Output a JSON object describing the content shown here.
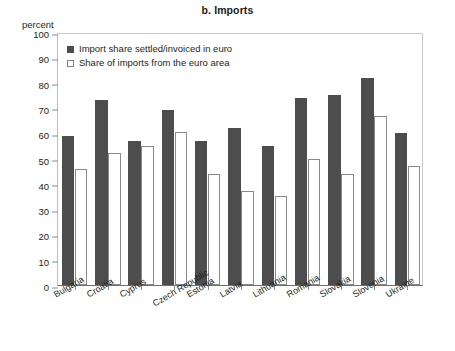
{
  "chart_data": {
    "type": "bar",
    "title": "b. Imports",
    "xlabel": "",
    "ylabel": "percent",
    "ylim": [
      0,
      100
    ],
    "yticks": [
      0,
      10,
      20,
      30,
      40,
      50,
      60,
      70,
      80,
      90,
      100
    ],
    "grid": false,
    "legend_position": "top-left",
    "categories": [
      "Bulgaria",
      "Croatia",
      "Cyprus",
      "Czech Republic",
      "Estonia",
      "Latvia",
      "Lithuania",
      "Romania",
      "Slovakia",
      "Slovenia",
      "Ukraine"
    ],
    "series": [
      {
        "name": "Import share settled/invoiced in euro",
        "color": "#4d4d4d",
        "values": [
          59,
          73,
          57,
          69,
          57,
          62,
          55,
          74,
          75,
          82,
          60
        ]
      },
      {
        "name": "Share of imports from the euro area",
        "color": "#ffffff",
        "values": [
          46,
          52,
          55,
          60.5,
          44,
          37,
          35,
          50,
          44,
          67,
          47
        ]
      }
    ]
  },
  "colors": {
    "series_dark": "#4d4d4d",
    "series_light_fill": "#ffffff",
    "series_light_stroke": "#8a8a8a",
    "axis": "#6f6f6f",
    "frame": "#c9c9c9",
    "text": "#231f20"
  }
}
